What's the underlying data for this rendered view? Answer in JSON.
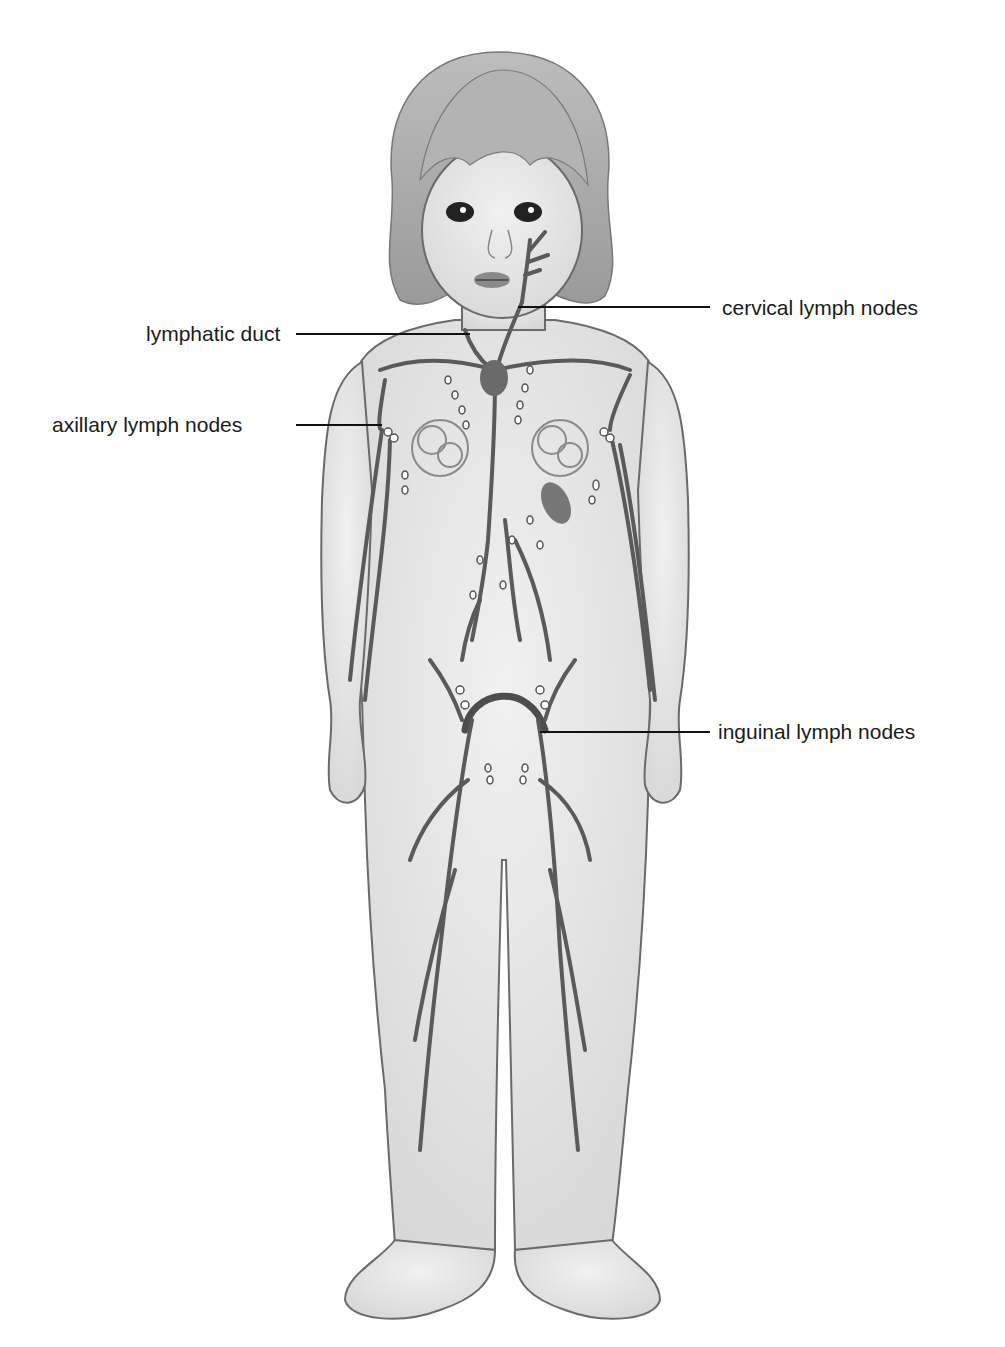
{
  "figure": {
    "colors": {
      "background": "#ffffff",
      "skin": "#e8e8e8",
      "outline": "#6a6a6a",
      "vessels": "#5a5a5a",
      "hair": "#a8a8a8",
      "label_text": "#1a1a1a",
      "leader_line": "#111111"
    }
  },
  "labels": [
    {
      "id": "cervical",
      "text": "cervical lymph nodes",
      "side": "right"
    },
    {
      "id": "lymphatic_duct",
      "text": "lymphatic duct",
      "side": "left"
    },
    {
      "id": "axillary",
      "text": "axillary lymph nodes",
      "side": "left"
    },
    {
      "id": "inguinal",
      "text": "inguinal lymph nodes",
      "side": "right"
    }
  ]
}
